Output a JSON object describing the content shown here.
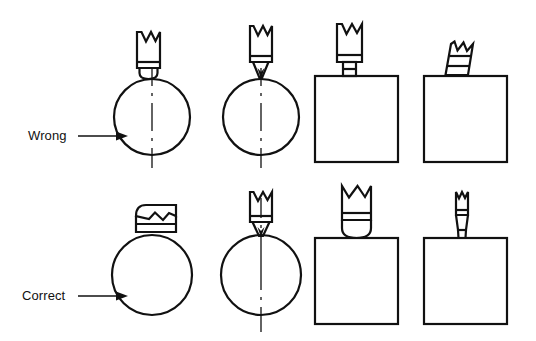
{
  "figure": {
    "ink_color": "#111111",
    "background_color": "#ffffff",
    "rows": [
      {
        "id": "wrong",
        "label": "Wrong",
        "arrow": "right-arrow",
        "label_x": 28,
        "label_y": 140,
        "arrow_x1": 82,
        "arrow_x2": 120,
        "arrow_y": 136,
        "figures": [
          {
            "id": "wrong-circle-flat-tool",
            "shape": "circle",
            "shape_cx": 152,
            "shape_cy": 117,
            "shape_r": 38,
            "centerline": true,
            "tool": "flat-end-tool-vertical",
            "tool_note": "flat bottom tool resting tangent on top of circle, drawn too wide"
          },
          {
            "id": "wrong-circle-pointed-tool",
            "shape": "circle",
            "shape_cx": 261,
            "shape_cy": 117,
            "shape_r": 38,
            "centerline": true,
            "tool": "pointed-tip-tool-vertical",
            "tool_note": "sharp pointed tool touching the top of circle"
          },
          {
            "id": "wrong-square-stepped-tool",
            "shape": "square",
            "shape_x": 315,
            "shape_y": 76,
            "shape_w": 83,
            "shape_h": 86,
            "centerline": false,
            "tool": "stepped-shank-tool-vertical",
            "tool_note": "tool with narrow stepped shank on top edge of square"
          },
          {
            "id": "wrong-square-tilted-tool",
            "shape": "square",
            "shape_x": 424,
            "shape_y": 76,
            "shape_w": 83,
            "shape_h": 86,
            "centerline": false,
            "tool": "tilted-tool",
            "tool_note": "tool leaning at an angle on the top edge of square"
          }
        ]
      },
      {
        "id": "correct",
        "label": "Correct",
        "arrow": "right-arrow",
        "label_x": 22,
        "label_y": 300,
        "arrow_x1": 82,
        "arrow_x2": 120,
        "arrow_y": 296,
        "figures": [
          {
            "id": "correct-circle-flattened-tool",
            "shape": "circle",
            "shape_cx": 152,
            "shape_cy": 275,
            "shape_r": 40,
            "centerline": false,
            "tool": "flattened-tool-horizontal",
            "tool_note": "tool drawn squat/flattened sitting squarely on circle"
          },
          {
            "id": "correct-circle-pointed-tool",
            "shape": "circle",
            "shape_cx": 261,
            "shape_cy": 275,
            "shape_r": 40,
            "centerline": true,
            "tool": "pointed-tip-tool-vertical",
            "tool_note": "sharp pointed tool aligned with circle centerline"
          },
          {
            "id": "correct-square-round-tool",
            "shape": "square",
            "shape_x": 315,
            "shape_y": 238,
            "shape_w": 83,
            "shape_h": 86,
            "centerline": false,
            "tool": "round-nose-tool-vertical",
            "tool_note": "uniform width tool with rounded nose on square"
          },
          {
            "id": "correct-square-slim-tool",
            "shape": "square",
            "shape_x": 424,
            "shape_y": 238,
            "shape_w": 83,
            "shape_h": 86,
            "centerline": false,
            "tool": "slim-tapered-tool-vertical",
            "tool_note": "slim tapered tool standing upright on square"
          }
        ]
      }
    ]
  }
}
